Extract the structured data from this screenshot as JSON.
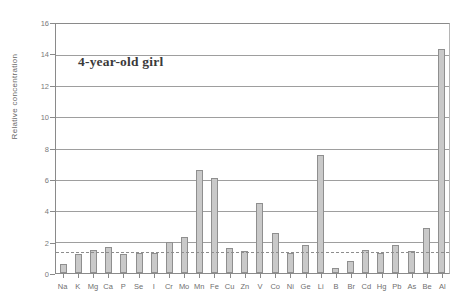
{
  "chart_data": {
    "type": "bar",
    "title": "4-year-old girl",
    "xlabel": "",
    "ylabel": "Relative concentration",
    "ylim": [
      0,
      16
    ],
    "yticks": [
      0,
      2,
      4,
      6,
      8,
      10,
      12,
      14,
      16
    ],
    "grid": true,
    "legend": "none",
    "reference_line": {
      "value": 1.33,
      "style": "dashed",
      "label": ""
    },
    "categories": [
      "Na",
      "K",
      "Mg",
      "Ca",
      "P",
      "Se",
      "I",
      "Cr",
      "Mo",
      "Mn",
      "Fe",
      "Cu",
      "Zn",
      "V",
      "Co",
      "Ni",
      "Ge",
      "Li",
      "B",
      "Br",
      "Cd",
      "Hg",
      "Pb",
      "As",
      "Be",
      "Al"
    ],
    "values": [
      0.6,
      1.2,
      1.5,
      1.7,
      1.2,
      1.3,
      1.3,
      2.0,
      2.3,
      6.6,
      6.1,
      1.6,
      1.4,
      4.5,
      2.6,
      1.3,
      1.8,
      7.6,
      0.35,
      0.8,
      1.5,
      1.3,
      1.8,
      1.4,
      2.9,
      14.4
    ],
    "series_name": "Relative concentration"
  },
  "axes": {
    "y_title": "Relative concentration"
  }
}
